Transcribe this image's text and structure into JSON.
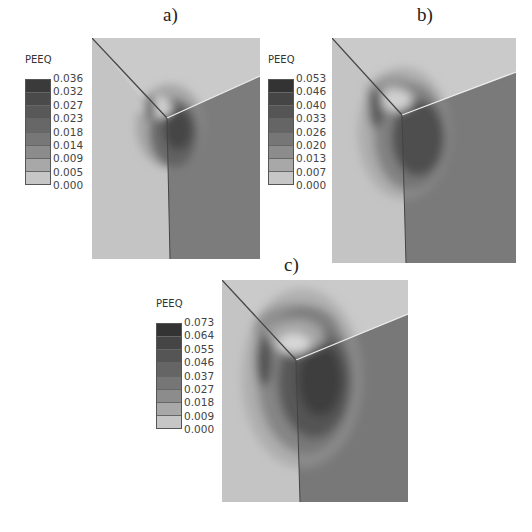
{
  "figure": {
    "panels": [
      {
        "id": "a",
        "label": "a)",
        "legend": {
          "title": "PEEQ",
          "ticks": [
            "0.036",
            "0.032",
            "0.027",
            "0.023",
            "0.018",
            "0.014",
            "0.009",
            "0.005",
            "0.000"
          ]
        }
      },
      {
        "id": "b",
        "label": "b)",
        "legend": {
          "title": "PEEQ",
          "ticks": [
            "0.053",
            "0.046",
            "0.040",
            "0.033",
            "0.026",
            "0.020",
            "0.013",
            "0.007",
            "0.000"
          ]
        }
      },
      {
        "id": "c",
        "label": "c)",
        "legend": {
          "title": "PEEQ",
          "ticks": [
            "0.073",
            "0.064",
            "0.055",
            "0.046",
            "0.037",
            "0.027",
            "0.018",
            "0.009",
            "0.000"
          ]
        }
      }
    ],
    "colors": {
      "bands": [
        "#3a3a3a",
        "#4a4a4a",
        "#585858",
        "#676767",
        "#777777",
        "#878787",
        "#a0a0a0",
        "#bdbdbd",
        "#d6d6d6"
      ],
      "top_face": "#c8c8c8",
      "left_face": "#c0c0c0",
      "right_face": "#7a7a7a",
      "edge_line": "#444444"
    }
  }
}
